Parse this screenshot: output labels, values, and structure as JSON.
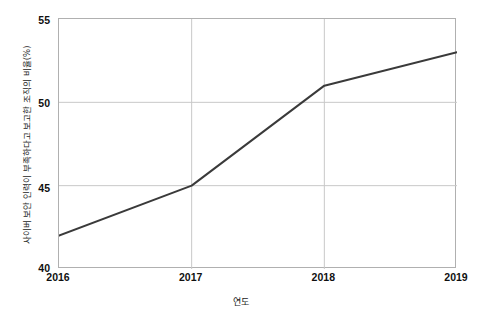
{
  "chart_data": {
    "type": "line",
    "title": "",
    "xlabel": "연도",
    "ylabel": "사이버 보안 인력이 부족하다고 보고한 조직의 비율(%)",
    "categories": [
      "2016",
      "2017",
      "2018",
      "2019"
    ],
    "x": [
      2016,
      2017,
      2018,
      2019
    ],
    "values": [
      42.0,
      45.0,
      51.0,
      53.0
    ],
    "series": [
      {
        "name": "사이버 보안 인력 부족 보고 비율",
        "values": [
          42.0,
          45.0,
          51.0,
          53.0
        ]
      }
    ],
    "xlim": [
      2016,
      2019
    ],
    "ylim": [
      40,
      55
    ],
    "xticks": [
      "2016",
      "2017",
      "2018",
      "2019"
    ],
    "yticks": [
      "40",
      "45",
      "50",
      "55"
    ],
    "ytick_values": [
      40,
      45,
      50,
      55
    ],
    "grid": true,
    "grid_axes": "both",
    "legend": false,
    "legend_position": "none",
    "markers": false,
    "line_color": "#3a3a3a",
    "line_width": 2,
    "grid_color": "#c8c8c8",
    "axis_color": "#b0b0b0",
    "background_color": "#ffffff",
    "annotations": []
  },
  "axis": {
    "y_tick_0": "40",
    "y_tick_1": "45",
    "y_tick_2": "50",
    "y_tick_3": "55",
    "x_tick_0": "2016",
    "x_tick_1": "2017",
    "x_tick_2": "2018",
    "x_tick_3": "2019"
  }
}
